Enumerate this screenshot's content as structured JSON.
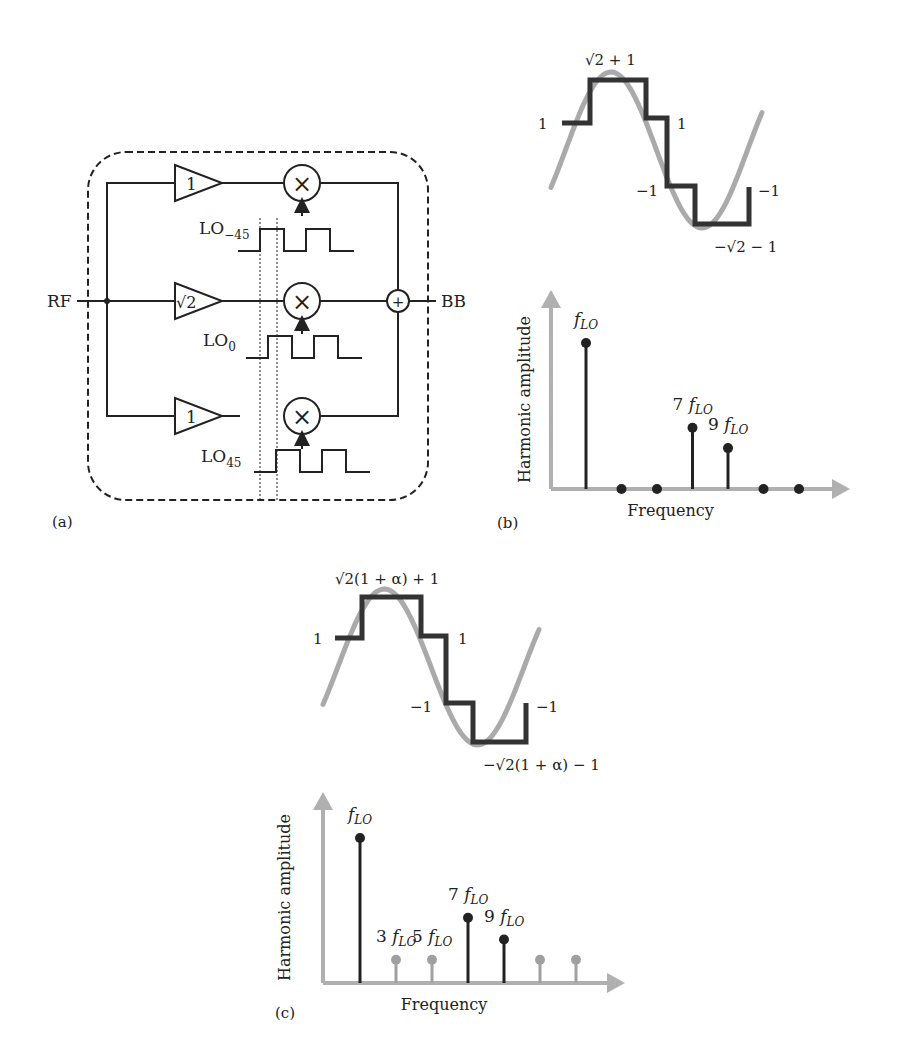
{
  "panel_a": {
    "label": "(a)",
    "input_label": "RF",
    "output_label": "BB",
    "sum_symbol": "+",
    "mixer_symbol": "×",
    "branches": [
      {
        "gain": "1",
        "lo_main": "LO",
        "lo_sub": "−45"
      },
      {
        "gain": "√2",
        "lo_main": "LO",
        "lo_sub": "0"
      },
      {
        "gain": "1",
        "lo_main": "LO",
        "lo_sub": "45"
      }
    ]
  },
  "panel_b": {
    "label": "(b)",
    "waveform_labels": {
      "peak": "√2 + 1",
      "left": "1",
      "right_high": "1",
      "right_low": "−1",
      "end": "−1",
      "trough": "−√2 − 1"
    },
    "levels": [
      1,
      2.414,
      2.414,
      1,
      -1,
      -2.414,
      -2.414,
      -1
    ]
  },
  "panel_c": {
    "label": "(c)",
    "waveform_labels": {
      "peak": "√2(1 + α) + 1",
      "left": "1",
      "right_high": "1",
      "right_low": "−1",
      "end": "−1",
      "trough": "−√2(1 + α) − 1"
    }
  },
  "chart_data": [
    {
      "type": "stem",
      "panel": "b",
      "title": "",
      "xlabel": "Frequency",
      "ylabel": "Harmonic amplitude",
      "categories": [
        "fLO",
        "3fLO",
        "5fLO",
        "7fLO",
        "9fLO",
        "11fLO",
        "13fLO"
      ],
      "values": [
        1.0,
        0,
        0,
        0.42,
        0.28,
        0,
        0
      ],
      "annotations": [
        {
          "index": 0,
          "coef": "",
          "text": "f",
          "sub": "LO"
        },
        {
          "index": 3,
          "coef": "7",
          "text": "f",
          "sub": "LO"
        },
        {
          "index": 4,
          "coef": "9",
          "text": "f",
          "sub": "LO"
        }
      ],
      "highlight": [
        true,
        false,
        false,
        true,
        true,
        false,
        false
      ]
    },
    {
      "type": "stem",
      "panel": "c",
      "title": "",
      "xlabel": "Frequency",
      "ylabel": "Harmonic amplitude",
      "categories": [
        "fLO",
        "3fLO",
        "5fLO",
        "7fLO",
        "9fLO",
        "11fLO",
        "13fLO"
      ],
      "values": [
        1.0,
        0.16,
        0.16,
        0.45,
        0.3,
        0.16,
        0.16
      ],
      "annotations": [
        {
          "index": 0,
          "coef": "",
          "text": "f",
          "sub": "LO"
        },
        {
          "index": 1,
          "coef": "3",
          "text": "f",
          "sub": "LO"
        },
        {
          "index": 2,
          "coef": "5",
          "text": "f",
          "sub": "LO"
        },
        {
          "index": 3,
          "coef": "7",
          "text": "f",
          "sub": "LO"
        },
        {
          "index": 4,
          "coef": "9",
          "text": "f",
          "sub": "LO"
        }
      ],
      "highlight": [
        true,
        false,
        false,
        true,
        true,
        false,
        false
      ]
    }
  ]
}
